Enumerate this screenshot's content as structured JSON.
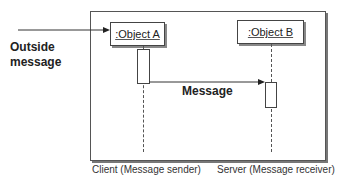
{
  "diagram": {
    "type": "UML sequence diagram",
    "outside_message": {
      "line1": "Outside",
      "line2": "message"
    },
    "objects": [
      {
        "label": ":Object A",
        "role": "Client (Message sender)"
      },
      {
        "label": ":Object B",
        "role": "Server (Message receiver)"
      }
    ],
    "message_label": "Message"
  }
}
